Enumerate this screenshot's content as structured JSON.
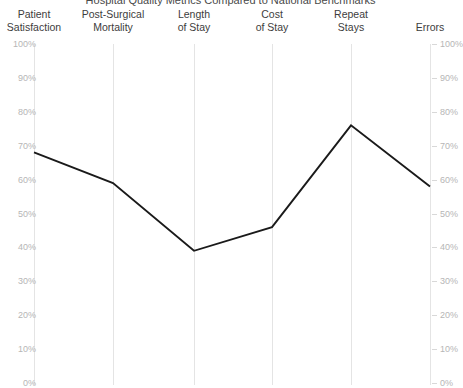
{
  "chart_data": {
    "type": "line",
    "title": "Hospital Quality Metrics Compared to National Benchmarks",
    "categories": [
      "Patient Satisfaction",
      "Post-Surgical Mortality",
      "Length of Stay",
      "Cost of Stay",
      "Repeat Stays",
      "Errors"
    ],
    "category_lines": [
      [
        "Patient",
        "Satisfaction"
      ],
      [
        "Post-Surgical",
        "Mortality"
      ],
      [
        "Length",
        "of Stay"
      ],
      [
        "Cost",
        "of Stay"
      ],
      [
        "Repeat",
        "Stays"
      ],
      [
        "Errors",
        ""
      ]
    ],
    "values": [
      68,
      59,
      39,
      46,
      76,
      58
    ],
    "xlabel": "",
    "ylabel": "",
    "ylim": [
      0,
      100
    ],
    "y_ticks": [
      0,
      10,
      20,
      30,
      40,
      50,
      60,
      70,
      80,
      90,
      100
    ],
    "y_tick_labels": [
      "0%",
      "10%",
      "20%",
      "30%",
      "40%",
      "50%",
      "60%",
      "70%",
      "80%",
      "90%",
      "100%"
    ],
    "dual_axis": true,
    "right_axis_labels": [
      "0%",
      "10%",
      "20%",
      "30%",
      "40%",
      "50%",
      "60%",
      "70%",
      "80%",
      "90%",
      "100%"
    ],
    "grid": "vertical",
    "legend": "none",
    "series": [
      {
        "name": "Hospital Score",
        "values": [
          68,
          59,
          39,
          46,
          76,
          58
        ]
      }
    ]
  },
  "style": {
    "line_color": "#1a1a1a",
    "gridline_color": "#e4e4e4",
    "tick_label_color": "#b6b6b6",
    "category_label_color": "#3d3d3d",
    "background": "#ffffff"
  }
}
